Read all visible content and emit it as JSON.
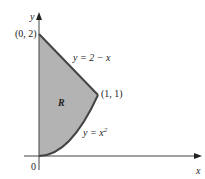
{
  "figure": {
    "axes": {
      "x_label": "x",
      "y_label": "y",
      "origin_label": "0"
    },
    "region": {
      "label": "R",
      "fill_color": "#b3b3b3",
      "boundary_color": "#444444"
    },
    "curves": {
      "line_label": "y = 2 − x",
      "parabola_label": "y = x",
      "parabola_exponent": "2"
    },
    "points": {
      "top_point": "(0, 2)",
      "intersection_point": "(1, 1)"
    }
  }
}
